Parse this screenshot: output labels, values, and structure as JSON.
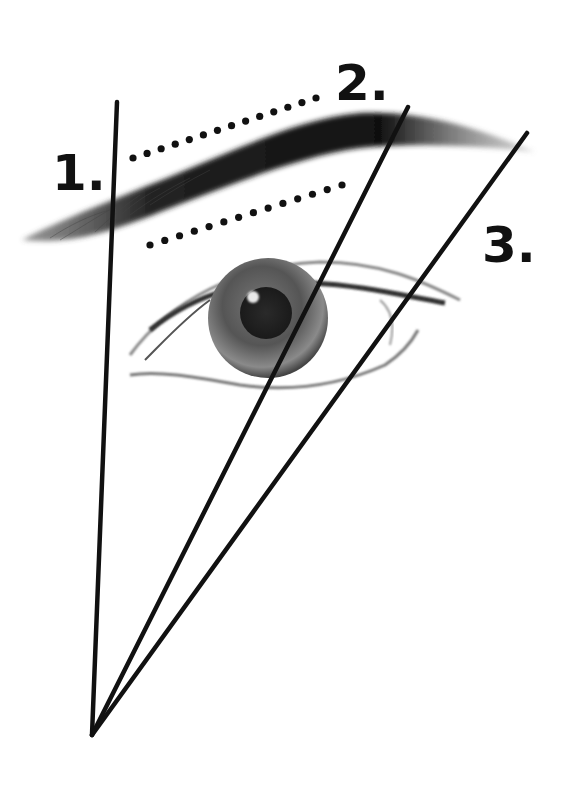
{
  "diagram": {
    "labels": [
      {
        "id": "1",
        "text": "1.",
        "meaning": "brow start"
      },
      {
        "id": "2",
        "text": "2.",
        "meaning": "brow arch"
      },
      {
        "id": "3",
        "text": "3.",
        "meaning": "brow end"
      }
    ],
    "guide_lines": [
      {
        "id": "line-1",
        "label": "1."
      },
      {
        "id": "line-2",
        "label": "2."
      },
      {
        "id": "line-3",
        "label": "3."
      }
    ],
    "dotted_guides": [
      {
        "id": "upper-dotted-guide",
        "dots": 14
      },
      {
        "id": "lower-dotted-guide",
        "dots": 14
      }
    ],
    "colors": {
      "line": "#111111",
      "brow": "#1a1a1a",
      "iris": "#555555",
      "pupil": "#222222",
      "background": "#ffffff"
    }
  }
}
